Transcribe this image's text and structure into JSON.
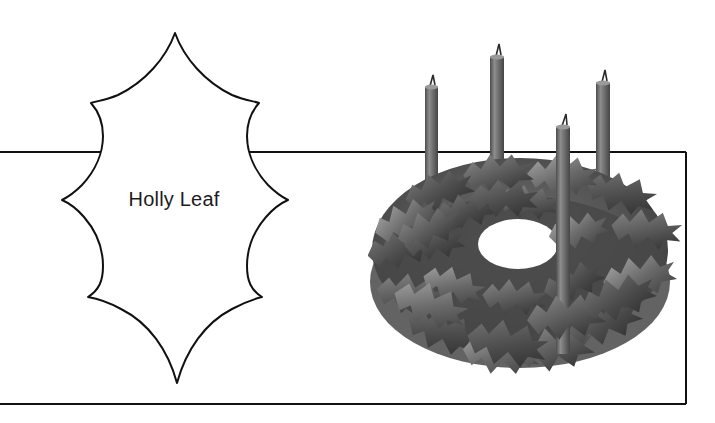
{
  "page": {
    "width": 715,
    "height": 423,
    "background_color": "#ffffff",
    "kind": "craft-pattern-sheet"
  },
  "pattern": {
    "label": "Holly Leaf",
    "label_color": "#1d1d1d",
    "outline_color": "#111111",
    "outline_width": 2,
    "fill_color": "#ffffff",
    "shape": "holly-leaf-template",
    "spike_count": 8,
    "tip_top": {
      "x": 175,
      "y": 33
    },
    "tip_bottom": {
      "x": 177,
      "y": 383
    },
    "spikes_left": [
      {
        "x": 91,
        "y": 103
      },
      {
        "x": 62,
        "y": 200
      },
      {
        "x": 88,
        "y": 297
      }
    ],
    "spikes_right": [
      {
        "x": 259,
        "y": 103
      },
      {
        "x": 288,
        "y": 200
      },
      {
        "x": 262,
        "y": 297
      }
    ]
  },
  "guides": {
    "horizontal_rule_y": 152,
    "baseline_rule_y": 404,
    "right_edge_x": 686,
    "rule_color": "#111111",
    "rule_width": 2
  },
  "photo": {
    "subject": "advent-wreath-with-four-candles",
    "candle_count": 4,
    "palette": {
      "leaf_dark": "#3f3f3f",
      "leaf_mid": "#5e5e5e",
      "leaf_light": "#8c8c8c",
      "leaf_highlight": "#b4b4b4",
      "candle_dark": "#4a4a4a",
      "candle_mid": "#6b6b6b",
      "candle_light": "#8f8f8f",
      "wick": "#2a2a2a",
      "background": "#ffffff"
    },
    "candles": [
      {
        "name": "candle-back-left",
        "x": 57,
        "top": 52,
        "height": 226,
        "width": 13
      },
      {
        "name": "candle-back-mid",
        "x": 122,
        "top": 22,
        "height": 252,
        "width": 14
      },
      {
        "name": "candle-front-mid",
        "x": 188,
        "top": 92,
        "height": 228,
        "width": 14
      },
      {
        "name": "candle-back-right",
        "x": 228,
        "top": 48,
        "height": 222,
        "width": 14
      }
    ]
  },
  "icons": {
    "leaf": "holly-leaf-icon",
    "candle": "candle-icon",
    "flame": "wick-icon"
  }
}
